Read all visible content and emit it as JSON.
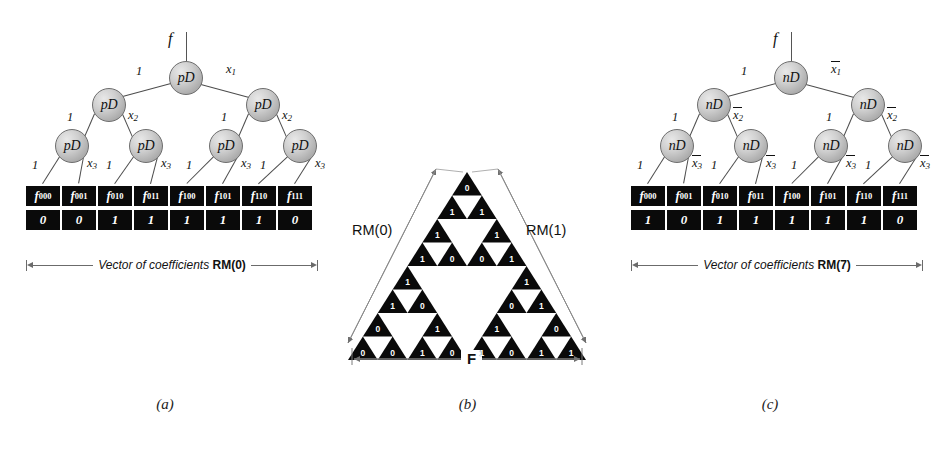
{
  "figure": {
    "background": "#ffffff",
    "node_fill": "#c9c9c9",
    "box_fill": "#0a0a0a",
    "digit_color": "#ffffff"
  },
  "panel_a": {
    "caption": "(a)",
    "root_label": "f",
    "node_label": "pD",
    "levels": [
      {
        "left_label": "1",
        "right_label": "x",
        "right_sub": "1"
      },
      {
        "left_label": "1",
        "right_label": "x",
        "right_sub": "2"
      },
      {
        "left_label": "1",
        "right_label": "x",
        "right_sub": "3"
      }
    ],
    "edge_labels_l1": [
      "1"
    ],
    "edge_labels_l1r": [
      "x1"
    ],
    "leaf_names": [
      "f000",
      "f001",
      "f010",
      "f011",
      "f100",
      "f101",
      "f110",
      "f111"
    ],
    "leaf_name_base": "f",
    "leaf_name_subs": [
      "000",
      "001",
      "010",
      "011",
      "100",
      "101",
      "110",
      "111"
    ],
    "leaf_values": [
      "0",
      "0",
      "1",
      "1",
      "1",
      "1",
      "1",
      "0"
    ],
    "vector_caption_text": "Vector of coefficients ",
    "vector_caption_bold": "RM(0)"
  },
  "panel_b": {
    "caption": "(b)",
    "left_label": "RM(0)",
    "right_label": "RM(1)",
    "bottom_label": "F",
    "rows": [
      [
        "0"
      ],
      [
        "1",
        "1"
      ],
      [
        "1",
        "",
        "1"
      ],
      [
        "1",
        "0",
        "0",
        "1"
      ],
      [
        "1",
        "",
        "",
        "",
        "1"
      ],
      [
        "1",
        "0",
        "",
        "",
        "0",
        "1"
      ],
      [
        "0",
        "",
        "1",
        "",
        "1",
        "",
        "0"
      ],
      [
        "0",
        "0",
        "1",
        "0",
        "1",
        "0",
        "1",
        "1"
      ]
    ]
  },
  "panel_c": {
    "caption": "(c)",
    "root_label": "f",
    "node_label": "nD",
    "leaf_name_base": "f",
    "leaf_name_subs": [
      "000",
      "001",
      "010",
      "011",
      "100",
      "101",
      "110",
      "111"
    ],
    "leaf_values": [
      "1",
      "0",
      "1",
      "1",
      "1",
      "1",
      "1",
      "0"
    ],
    "edge_left_label": "1",
    "edge_right_base": "x",
    "edge_right_subs": [
      "1",
      "2",
      "3"
    ],
    "edge_right_overline": true,
    "vector_caption_text": "Vector of coefficients ",
    "vector_caption_bold": "RM(7)"
  }
}
